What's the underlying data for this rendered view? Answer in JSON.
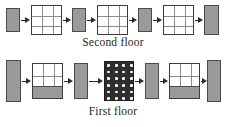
{
  "figure": {
    "kind": "architectural-sequence-diagram",
    "background": "#ffffff",
    "width": 226,
    "height": 127,
    "colors": {
      "wall_fill": "#9a9a9a",
      "wall_stroke": "#4a4a4a",
      "panel_fill": "#ffffff",
      "panel_stroke": "#3d3d3d",
      "grid_line": "#8d8d8d",
      "dotted_panel_fill": "#2e2e2e",
      "dot_color": "#ffffff",
      "arrow_color": "#2b2b2b",
      "text_color": "#262626"
    }
  },
  "rows": [
    {
      "id": "second-floor",
      "caption": "Second floor",
      "units": [
        {
          "type": "bar",
          "name": "wall-s1",
          "x": 6,
          "y": 8,
          "w": 14,
          "h": 24
        },
        {
          "type": "panel",
          "name": "panel-s1",
          "x": 31,
          "y": 5,
          "w": 31,
          "h": 30,
          "cols": 3,
          "rows": 3,
          "fill_ratio": 0
        },
        {
          "type": "bar",
          "name": "wall-s2",
          "x": 72,
          "y": 8,
          "w": 14,
          "h": 24
        },
        {
          "type": "panel",
          "name": "panel-s2",
          "x": 97,
          "y": 5,
          "w": 31,
          "h": 30,
          "cols": 3,
          "rows": 3,
          "fill_ratio": 0
        },
        {
          "type": "bar",
          "name": "wall-s3",
          "x": 138,
          "y": 8,
          "w": 14,
          "h": 24
        },
        {
          "type": "panel",
          "name": "panel-s3",
          "x": 163,
          "y": 5,
          "w": 31,
          "h": 30,
          "cols": 3,
          "rows": 3,
          "fill_ratio": 0
        },
        {
          "type": "bar",
          "name": "wall-s4",
          "x": 204,
          "y": 5,
          "w": 15,
          "h": 30
        }
      ],
      "arrows": [
        {
          "name": "arrow-s1",
          "x": 21,
          "y": 17,
          "w": 9
        },
        {
          "name": "arrow-s2",
          "x": 63,
          "y": 17,
          "w": 8
        },
        {
          "name": "arrow-s3",
          "x": 87,
          "y": 17,
          "w": 9
        },
        {
          "name": "arrow-s4",
          "x": 129,
          "y": 17,
          "w": 8
        },
        {
          "name": "arrow-s5",
          "x": 153,
          "y": 17,
          "w": 9
        },
        {
          "name": "arrow-s6",
          "x": 195,
          "y": 17,
          "w": 8
        }
      ]
    },
    {
      "id": "first-floor",
      "caption": "First floor",
      "units": [
        {
          "type": "bar",
          "name": "wall-f1",
          "x": 6,
          "y": 60,
          "w": 15,
          "h": 42
        },
        {
          "type": "panel",
          "name": "panel-f1",
          "x": 32,
          "y": 63,
          "w": 31,
          "h": 36,
          "cols": 3,
          "rows": 3,
          "fill_ratio": 0.33
        },
        {
          "type": "bar",
          "name": "wall-f2",
          "x": 74,
          "y": 63,
          "w": 14,
          "h": 36
        },
        {
          "type": "dotted",
          "name": "panel-f2",
          "x": 104,
          "y": 61,
          "w": 30,
          "h": 40,
          "dot_cols": 4,
          "dot_rows": 6
        },
        {
          "type": "bar",
          "name": "wall-f3",
          "x": 145,
          "y": 63,
          "w": 14,
          "h": 36
        },
        {
          "type": "panel",
          "name": "panel-f3",
          "x": 169,
          "y": 63,
          "w": 31,
          "h": 36,
          "cols": 3,
          "rows": 3,
          "fill_ratio": 0.33
        },
        {
          "type": "bar",
          "name": "wall-f4",
          "x": 207,
          "y": 60,
          "w": 14,
          "h": 42
        }
      ],
      "arrows": [
        {
          "name": "arrow-f1",
          "x": 22,
          "y": 78,
          "w": 9
        },
        {
          "name": "arrow-f2",
          "x": 64,
          "y": 78,
          "w": 9
        },
        {
          "name": "arrow-f3",
          "x": 89,
          "y": 78,
          "w": 14
        },
        {
          "name": "arrow-f4",
          "x": 135,
          "y": 78,
          "w": 9
        },
        {
          "name": "arrow-f5",
          "x": 160,
          "y": 78,
          "w": 8
        },
        {
          "name": "arrow-f6",
          "x": 201,
          "y": 78,
          "w": 6
        }
      ]
    }
  ]
}
